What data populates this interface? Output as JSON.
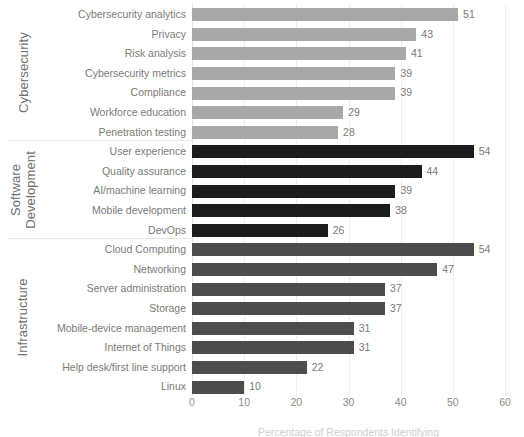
{
  "chart_data": {
    "type": "bar",
    "orientation": "horizontal",
    "title": "",
    "xlabel": "Percentage of Respondents Identifying",
    "ylabel": "",
    "xlim": [
      0,
      60
    ],
    "xticks": [
      0,
      10,
      20,
      30,
      40,
      50,
      60
    ],
    "grid": true,
    "legend": "none",
    "value_labels": true,
    "groups": [
      {
        "name": "Cybersecurity",
        "name_lines": [
          "Cybersecurity"
        ],
        "color": "#a8a8a8",
        "color_class": "c-cyber",
        "categories": [
          "Cybersecurity analytics",
          "Privacy",
          "Risk analysis",
          "Cybersecurity metrics",
          "Compliance",
          "Workforce education",
          "Penetration testing"
        ],
        "values": [
          51,
          43,
          41,
          39,
          39,
          29,
          28
        ]
      },
      {
        "name": "Software Development",
        "name_lines": [
          "Software",
          "Development"
        ],
        "color": "#1c1c1c",
        "color_class": "c-softdev",
        "categories": [
          "User experience",
          "Quality assurance",
          "AI/machine learning",
          "Mobile development",
          "DevOps"
        ],
        "values": [
          54,
          44,
          39,
          38,
          26
        ]
      },
      {
        "name": "Infrastructure",
        "name_lines": [
          "Infrastructure"
        ],
        "color": "#4d4d4d",
        "color_class": "c-infra",
        "categories": [
          "Cloud Computing",
          "Networking",
          "Server administration",
          "Storage",
          "Mobile-device management",
          "Internet of Things",
          "Help desk/first line support",
          "Linux"
        ],
        "values": [
          54,
          47,
          37,
          37,
          31,
          31,
          22,
          10
        ]
      }
    ]
  }
}
